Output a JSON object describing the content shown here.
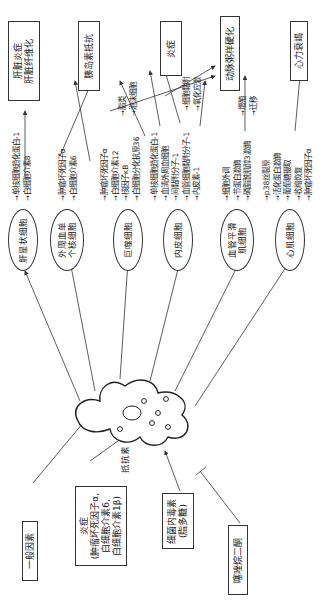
{
  "diagram": {
    "orientation": "rotated -90deg (reads bottom to top)",
    "center": {
      "label": "抵抗素",
      "shape": "adipocyte-cell-icon"
    },
    "inputs": [
      {
        "id": "general",
        "label": "一般因素",
        "relation": "stimulates"
      },
      {
        "id": "inflammation",
        "lines": [
          "炎症",
          "(肿瘤坏死因子α,",
          "白细胞介素6,",
          "白细胞介素1β)"
        ],
        "relation": "stimulates"
      },
      {
        "id": "lps",
        "lines": [
          "细菌内毒素",
          "(脂多糖)"
        ],
        "relation": "stimulates"
      },
      {
        "id": "tzd",
        "label": "噻唑烷二酮",
        "relation": "inhibits"
      }
    ],
    "cells": [
      {
        "id": "hsc",
        "lines": [
          "肝星状细胞"
        ],
        "mediators": [
          "单核细胞趋化蛋白-1",
          "白细胞介素8"
        ]
      },
      {
        "id": "pbmc",
        "lines": [
          "外周血单",
          "个核细胞"
        ],
        "mediators": [
          "肿瘤坏死因子α",
          "白细胞介素6"
        ]
      },
      {
        "id": "macrophage",
        "lines": [
          "巨噬细胞"
        ],
        "mediators": [
          "肿瘤坏死因子α",
          "白细胞介素12",
          "核因子κB",
          "白细胞分化抗原36"
        ]
      },
      {
        "id": "endothelial",
        "lines": [
          "内皮细胞"
        ],
        "mediators": [
          "单核细胞趋化蛋白-1",
          "血清外周血细胞",
          "间黏附分子-1",
          "血管细胞黏附分子-1",
          "内皮素-1"
        ]
      },
      {
        "id": "vsmc",
        "lines": [
          "血管平滑",
          "肌细胞"
        ],
        "mediators": [
          "细胞外调",
          "节蛋白激酶",
          "磷脂酰肌醇3激酶"
        ]
      },
      {
        "id": "cardiomyocyte",
        "lines": [
          "心肌细胞"
        ],
        "mediators": [
          "p38丝裂原",
          "活化蛋白激酶",
          "葡萄糖摄取",
          "收缩恢复",
          "肿瘤坏死因子α"
        ]
      }
    ],
    "effects": [
      {
        "group": "lipid",
        "items": [
          "脂类",
          "泡沫细胞"
        ]
      },
      {
        "group": "endo",
        "items": [
          "细胞黏附",
          "氧化应激"
        ]
      },
      {
        "group": "vsmc",
        "items": [
          "增殖",
          "迁移"
        ]
      }
    ],
    "outcomes": [
      {
        "id": "liver",
        "lines": [
          "肝脏炎症",
          "肝脏纤维化"
        ]
      },
      {
        "id": "ir",
        "lines": [
          "胰岛素抵抗"
        ]
      },
      {
        "id": "inflam",
        "lines": [
          "炎症"
        ]
      },
      {
        "id": "as",
        "lines": [
          "动脉粥样硬化"
        ]
      },
      {
        "id": "hf",
        "lines": [
          "心力衰竭"
        ]
      }
    ]
  }
}
